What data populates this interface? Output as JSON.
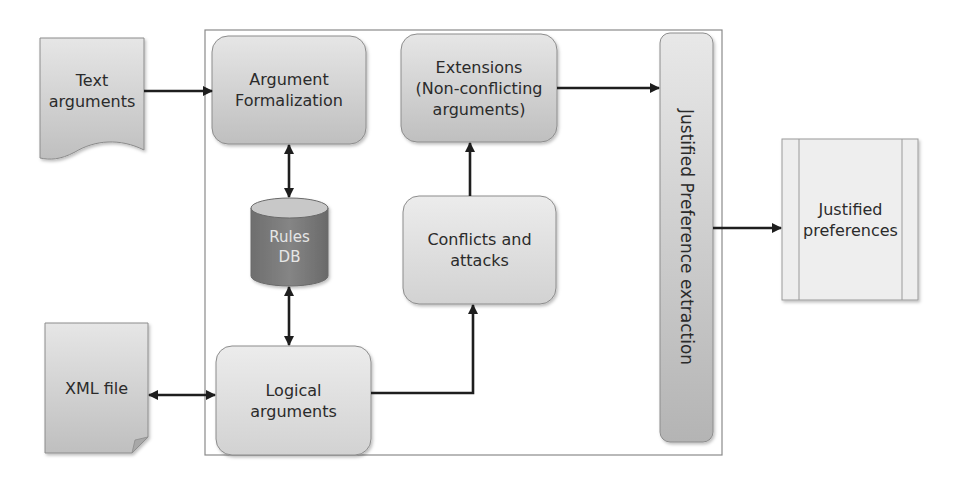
{
  "diagram": {
    "type": "flowchart",
    "container": {
      "label": ""
    },
    "nodes": {
      "text_arguments": {
        "label": "Text\narguments",
        "shape": "document"
      },
      "argument_formalization": {
        "label": "Argument\nFormalization",
        "shape": "rounded-rect"
      },
      "rules_db": {
        "label": "Rules\nDB",
        "shape": "cylinder"
      },
      "logical_arguments": {
        "label": "Logical\narguments",
        "shape": "rounded-rect"
      },
      "xml_file": {
        "label": "XML file",
        "shape": "folded-document"
      },
      "conflicts_attacks": {
        "label": "Conflicts and\nattacks",
        "shape": "rounded-rect"
      },
      "extensions": {
        "label": "Extensions\n(Non-conflicting\narguments)",
        "shape": "rounded-rect"
      },
      "justified_preference_extraction": {
        "label": "Justified Preference extraction",
        "shape": "vertical-rounded-bar"
      },
      "justified_preferences": {
        "label": "Justified\npreferences",
        "shape": "predefined-process"
      }
    },
    "edges": [
      {
        "from": "Text arguments",
        "to": "Argument Formalization",
        "direction": "one-way"
      },
      {
        "from": "Argument Formalization",
        "to": "Rules DB",
        "direction": "two-way"
      },
      {
        "from": "Rules DB",
        "to": "Logical arguments",
        "direction": "two-way"
      },
      {
        "from": "XML file",
        "to": "Logical arguments",
        "direction": "two-way"
      },
      {
        "from": "Logical arguments",
        "to": "Conflicts and attacks",
        "direction": "one-way"
      },
      {
        "from": "Conflicts and attacks",
        "to": "Extensions (Non-conflicting arguments)",
        "direction": "one-way"
      },
      {
        "from": "Extensions (Non-conflicting arguments)",
        "to": "Justified Preference extraction",
        "direction": "one-way"
      },
      {
        "from": "Justified Preference extraction",
        "to": "Justified preferences",
        "direction": "one-way"
      }
    ],
    "colors": {
      "box_fill_light": "#e4e4e4",
      "box_fill_dark": "#bdbdbd",
      "box_stroke": "#8c8c8c",
      "db_body": "#7a7a7a",
      "db_top": "#c8c8c8",
      "arrow": "#1e1e1e",
      "container_stroke": "#8a8a8a"
    }
  }
}
